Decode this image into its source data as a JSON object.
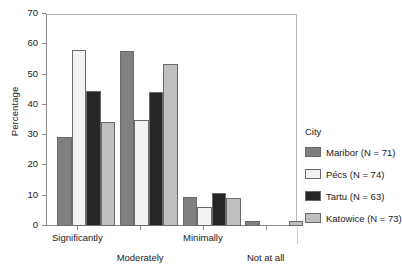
{
  "chart_data": {
    "type": "bar",
    "title": "",
    "xlabel": "",
    "ylabel": "Percentage",
    "ylim": [
      0,
      70
    ],
    "ytick_values": [
      0,
      10,
      20,
      30,
      40,
      50,
      60,
      70
    ],
    "ytick_labels": [
      "0",
      "10",
      "20",
      "30",
      "40",
      "50",
      "60",
      "70"
    ],
    "grid": false,
    "legend_position": "right",
    "legend_title": "City",
    "categories": [
      "Significantly",
      "Moderately",
      "Minimally",
      "Not at all"
    ],
    "series": [
      {
        "name": "Maribor (N = 71)",
        "color": "#808080",
        "values": [
          29.5,
          57.7,
          9.6,
          1.7
        ]
      },
      {
        "name": "Pécs (N = 74)",
        "color": "#f2f2f2",
        "values": [
          58.0,
          35.0,
          6.2,
          0.0
        ]
      },
      {
        "name": "Tartu (N = 63)",
        "color": "#262626",
        "values": [
          44.5,
          44.4,
          10.8,
          0.0
        ]
      },
      {
        "name": "Katowice (N = 73)",
        "color": "#bfbfbf",
        "values": [
          34.3,
          53.5,
          9.1,
          1.6
        ]
      }
    ]
  },
  "axis": {
    "y_title": "Percentage"
  },
  "legend": {
    "title": "City",
    "entries": [
      {
        "label": "Maribor (N = 71)",
        "color": "#808080"
      },
      {
        "label": "Pécs (N = 74)",
        "color": "#f2f2f2"
      },
      {
        "label": "Tartu (N = 63)",
        "color": "#262626"
      },
      {
        "label": "Katowice (N = 73)",
        "color": "#bfbfbf"
      }
    ]
  }
}
